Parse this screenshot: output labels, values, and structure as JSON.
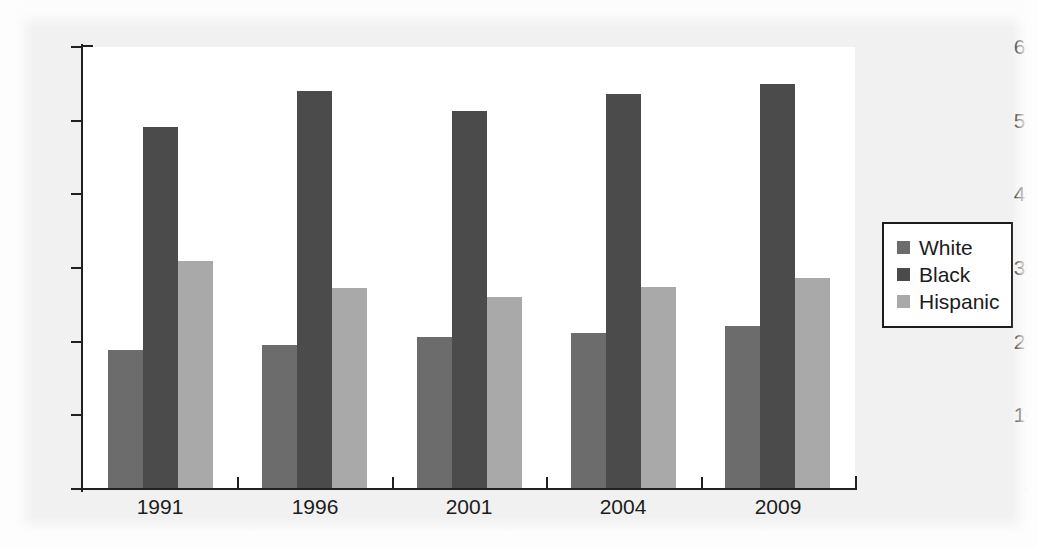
{
  "chart_data": {
    "type": "bar",
    "title": "",
    "subtitle": "",
    "xlabel": "",
    "ylabel": "",
    "categories": [
      "1991",
      "1996",
      "2001",
      "2004",
      "2009"
    ],
    "series": [
      {
        "name": "White",
        "color": "#6c6c6c",
        "values": [
          18.9,
          19.6,
          20.7,
          21.2,
          22.1
        ]
      },
      {
        "name": "Black",
        "color": "#4b4b4b",
        "values": [
          49.1,
          54.0,
          51.3,
          53.6,
          55.0
        ]
      },
      {
        "name": "Hispanic",
        "color": "#a9a9a9",
        "values": [
          31.0,
          27.3,
          26.1,
          27.4,
          28.7
        ]
      }
    ],
    "ylim": [
      0,
      60
    ],
    "yticks": [
      0,
      10,
      20,
      30,
      40,
      50,
      60
    ],
    "ytick_labels": [
      "0",
      "10",
      "20",
      "30",
      "40",
      "50",
      "60"
    ],
    "grid": true,
    "grid_axis": "y",
    "legend_position": "right",
    "legend_entries": [
      "White",
      "Black",
      "Hispanic"
    ],
    "annotations": []
  },
  "colors": {
    "figure_background": "#f1f1f1",
    "plot_background": "#ffffff",
    "axis": "#231f20",
    "gridline": "#e9e9ea",
    "text": "#1c1c1c",
    "legend_border": "#1c1c1c"
  }
}
